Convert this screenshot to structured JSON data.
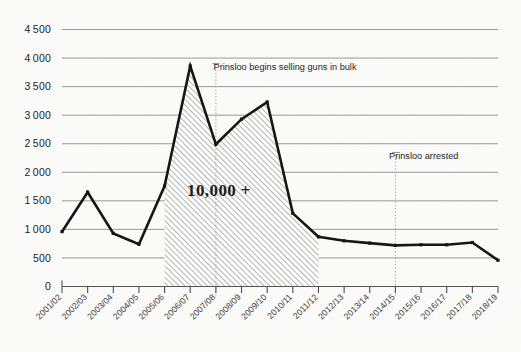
{
  "chart_data": {
    "type": "area",
    "title": "",
    "subtitle": "",
    "xlabel": "",
    "ylabel": "",
    "grid": true,
    "legend": false,
    "ylim": [
      0,
      4500
    ],
    "ytick_step": 500,
    "categories": [
      "2001/02",
      "2002/03",
      "2003/04",
      "2004/05",
      "2005/06",
      "2006/07",
      "2007/08",
      "2008/09",
      "2009/10",
      "2010/11",
      "2011/12",
      "2012/13",
      "2013/14",
      "2014/15",
      "2015/16",
      "2016/17",
      "2017/18",
      "2018/19"
    ],
    "values": [
      960,
      1650,
      930,
      740,
      1760,
      3860,
      2490,
      2930,
      3230,
      1280,
      870,
      800,
      760,
      720,
      730,
      730,
      770,
      460
    ],
    "ytick_labels": [
      "0",
      "500",
      "1000",
      "1500",
      "2000",
      "2500",
      "3000",
      "3500",
      "4000",
      "4500"
    ],
    "shaded_region": {
      "from_category": "2005/06",
      "to_category": "2011/12",
      "fill_label": "10,000 +",
      "pattern": "diagonal-hatch"
    },
    "annotations": [
      {
        "label": "Prinsloo begins selling guns in bulk",
        "at_category": "2007/08",
        "name": "annotation-bulk-selling"
      },
      {
        "label": "Prinsloo arrested",
        "at_category": "2014/15",
        "name": "annotation-arrest"
      }
    ],
    "colors": {
      "line": "#15150f",
      "grid": "#8d8d8d",
      "background": "#fbfbfa",
      "hatch": "#8a8a88",
      "annotation_leader": "#9a9a97"
    }
  }
}
